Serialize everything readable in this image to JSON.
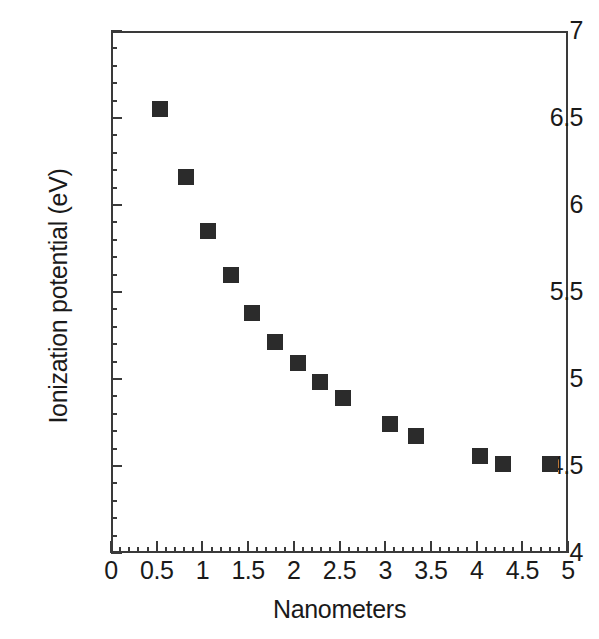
{
  "chart_data": {
    "type": "scatter",
    "title": "",
    "xlabel": "Nanometers",
    "ylabel": "Ionization potential (eV)",
    "xlim": [
      0,
      5
    ],
    "ylim": [
      4,
      7
    ],
    "grid": false,
    "legend": null,
    "x_major_ticks": [
      0,
      0.5,
      1,
      1.5,
      2,
      2.5,
      3,
      3.5,
      4,
      4.5,
      5
    ],
    "x_tick_labels": [
      "0",
      "0.5",
      "1",
      "1.5",
      "2",
      "2.5",
      "3",
      "3.5",
      "4",
      "4.5",
      "5"
    ],
    "x_minor_interval": 0.1,
    "y_major_ticks": [
      4,
      4.5,
      5,
      5.5,
      6,
      6.5,
      7
    ],
    "y_tick_labels": [
      "4",
      "4.5",
      "5",
      "5.5",
      "6",
      "6.5",
      "7"
    ],
    "y_minor_interval": 0.1,
    "marker": "square",
    "marker_color": "#2b2b2b",
    "marker_size_px": 16,
    "points": [
      {
        "x": 0.54,
        "y": 6.55
      },
      {
        "x": 0.82,
        "y": 6.16
      },
      {
        "x": 1.06,
        "y": 5.85
      },
      {
        "x": 1.31,
        "y": 5.6
      },
      {
        "x": 1.54,
        "y": 5.38
      },
      {
        "x": 1.79,
        "y": 5.21
      },
      {
        "x": 2.05,
        "y": 5.09
      },
      {
        "x": 2.29,
        "y": 4.98
      },
      {
        "x": 2.54,
        "y": 4.89
      },
      {
        "x": 3.05,
        "y": 4.74
      },
      {
        "x": 3.34,
        "y": 4.67
      },
      {
        "x": 4.04,
        "y": 4.56
      },
      {
        "x": 4.29,
        "y": 4.51
      },
      {
        "x": 4.8,
        "y": 4.51
      }
    ]
  },
  "figure": {
    "frame_color": "#3a3a3a",
    "background": "#ffffff"
  },
  "caption_fragment": ""
}
